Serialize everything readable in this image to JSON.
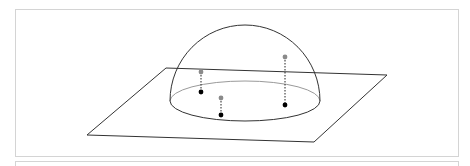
{
  "diagram": {
    "colors": {
      "line": "#333333",
      "back_rim": "#9a9a9a",
      "grey_point": "#8a8a8a",
      "black_point": "#000000",
      "panel_border": "#d4d4d4"
    },
    "plane": {
      "corners": [
        [
          166,
          68
        ],
        [
          387,
          75
        ],
        [
          314,
          142
        ],
        [
          87,
          135
        ]
      ]
    },
    "hemisphere": {
      "center": [
        245,
        101
      ],
      "rx": 75,
      "ry": 20,
      "top_y": 25
    },
    "point_pairs": [
      {
        "upper": [
          201,
          72
        ],
        "lower": [
          201,
          92
        ]
      },
      {
        "upper": [
          221,
          98
        ],
        "lower": [
          221,
          115
        ]
      },
      {
        "upper": [
          285,
          57
        ],
        "lower": [
          285,
          105
        ]
      }
    ]
  }
}
